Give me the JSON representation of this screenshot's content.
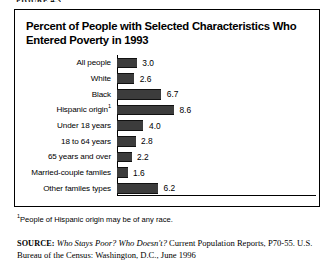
{
  "page": {
    "clipped_header": "FIGURE 4.3"
  },
  "figure": {
    "title": "Percent of People with Selected Characteristics Who Entered Poverty in 1993",
    "footnote_marker": "1",
    "footnote": "People of Hispanic origin may be of any race.",
    "source": {
      "label": "SOURCE:",
      "title": "Who Stays Poor? Who Doesn't?",
      "rest": " Current Population Reports, P70-55. U.S. Bureau of the Census: Washington, D.C., June 1996"
    }
  },
  "chart_data": {
    "type": "bar",
    "orientation": "horizontal",
    "title": "Percent of People with Selected Characteristics Who Entered Poverty in 1993",
    "xlabel": "",
    "ylabel": "",
    "xlim": [
      0,
      10
    ],
    "grid": false,
    "legend": null,
    "bar_color": "#3c3c3c",
    "categories": [
      "All people",
      "White",
      "Black",
      "Hispanic origin",
      "Under 18 years",
      "18 to 64 years",
      "65 years and over",
      "Married-couple familes",
      "Other familes types"
    ],
    "values": [
      3.0,
      2.6,
      6.7,
      8.6,
      4.0,
      2.8,
      2.2,
      1.6,
      6.2
    ],
    "value_labels": [
      "3.0",
      "2.6",
      "6.7",
      "8.6",
      "4.0",
      "2.8",
      "2.2",
      "1.6",
      "6.2"
    ],
    "category_footnotes": [
      "",
      "",
      "",
      "1",
      "",
      "",
      "",
      "",
      ""
    ]
  }
}
